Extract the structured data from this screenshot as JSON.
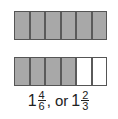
{
  "diagram": {
    "bars": [
      {
        "cells": 6,
        "shaded": 6
      },
      {
        "cells": 6,
        "shaded": 4
      }
    ],
    "caption": {
      "first": {
        "whole": "1",
        "numerator": "4",
        "denominator": "6"
      },
      "separator": ", or",
      "second": {
        "whole": "1",
        "numerator": "2",
        "denominator": "3"
      }
    },
    "colors": {
      "shaded": "#a8a8a8",
      "empty": "#ffffff",
      "border": "#555555"
    }
  }
}
